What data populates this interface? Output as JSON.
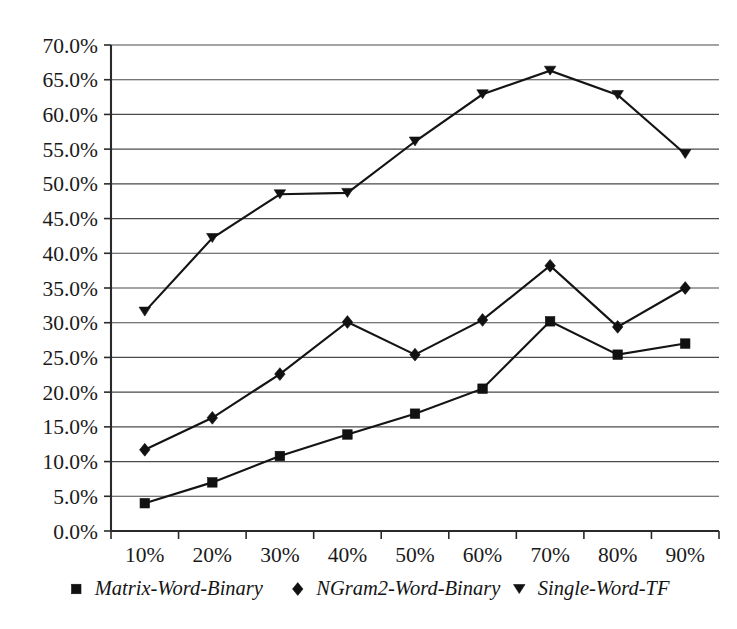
{
  "chart_data": {
    "type": "line",
    "title": "",
    "subtitle": "",
    "xlabel": "",
    "ylabel": "",
    "categories": [
      "10%",
      "20%",
      "30%",
      "40%",
      "50%",
      "60%",
      "70%",
      "80%",
      "90%"
    ],
    "x_tick_labels": [
      "10%",
      "20%",
      "30%",
      "40%",
      "50%",
      "60%",
      "70%",
      "80%",
      "90%"
    ],
    "y_tick_labels": [
      "0.0%",
      "5.0%",
      "10.0%",
      "15.0%",
      "20.0%",
      "25.0%",
      "30.0%",
      "35.0%",
      "40.0%",
      "45.0%",
      "50.0%",
      "55.0%",
      "60.0%",
      "65.0%",
      "70.0%"
    ],
    "y_tick_values": [
      0,
      5,
      10,
      15,
      20,
      25,
      30,
      35,
      40,
      45,
      50,
      55,
      60,
      65,
      70
    ],
    "ylim": [
      0,
      70
    ],
    "grid": true,
    "grid_axis": "y",
    "legend_position": "bottom",
    "series": [
      {
        "name": "Matrix-Word-Binary",
        "marker": "square",
        "color": "#111111",
        "values": [
          4.0,
          7.0,
          10.8,
          13.9,
          16.9,
          20.5,
          30.2,
          25.4,
          27.0
        ]
      },
      {
        "name": "NGram2-Word-Binary",
        "marker": "diamond",
        "color": "#111111",
        "values": [
          11.7,
          16.3,
          22.6,
          30.1,
          25.4,
          30.4,
          38.2,
          29.4,
          35.0
        ]
      },
      {
        "name": "Single-Word-TF",
        "marker": "triangle-down",
        "color": "#111111",
        "values": [
          31.6,
          42.2,
          48.5,
          48.7,
          56.1,
          62.9,
          66.3,
          62.8,
          54.3
        ]
      }
    ]
  },
  "legend": {
    "items": [
      {
        "label": "Matrix-Word-Binary",
        "marker": "square"
      },
      {
        "label": "NGram2-Word-Binary",
        "marker": "diamond"
      },
      {
        "label": "Single-Word-TF",
        "marker": "triangle-down"
      }
    ]
  },
  "plot_geometry": {
    "left": 111,
    "right": 719,
    "top": 45,
    "bottom": 531
  }
}
